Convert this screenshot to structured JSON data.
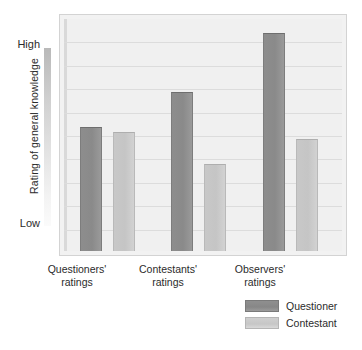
{
  "chart_data": {
    "type": "bar",
    "title": "",
    "xlabel": "",
    "ylabel": "Rating of general knowledge",
    "categories": [
      "Questioners' ratings",
      "Contestants' ratings",
      "Observers' ratings"
    ],
    "category_lines": [
      [
        "Questioners'",
        "ratings"
      ],
      [
        "Contestants'",
        "ratings"
      ],
      [
        "Observers'",
        "ratings"
      ]
    ],
    "series": [
      {
        "name": "Questioner",
        "color": "#8a8a8a",
        "values": [
          53,
          68,
          93
        ]
      },
      {
        "name": "Contestant",
        "color": "#c5c5c5",
        "values": [
          51,
          37,
          48
        ]
      }
    ],
    "ylim": [
      0,
      100
    ],
    "y_tick_labels": {
      "high": "High",
      "low": "Low"
    },
    "gridlines": 9,
    "grid": true,
    "legend_position": "bottom-right",
    "legend_entries": [
      "Questioner",
      "Contestant"
    ]
  },
  "axis": {
    "y_title": "Rating of general knowledge",
    "high_label": "High",
    "low_label": "Low"
  },
  "legend": {
    "items": [
      {
        "label": "Questioner"
      },
      {
        "label": "Contestant"
      }
    ]
  }
}
